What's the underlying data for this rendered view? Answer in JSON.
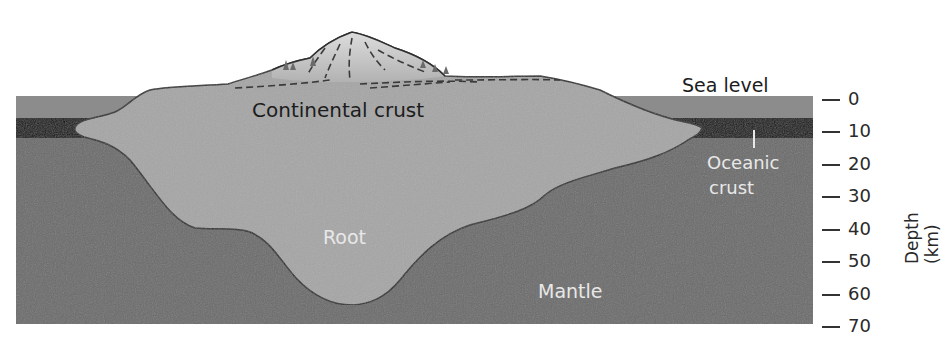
{
  "labels": {
    "sea_level": "Sea level",
    "continental_crust": "Continental crust",
    "oceanic_crust_line1": "Oceanic",
    "oceanic_crust_line2": "crust",
    "root": "Root",
    "mantle": "Mantle"
  },
  "axis": {
    "title": "Depth (km)",
    "ticks": [
      "0",
      "10",
      "20",
      "30",
      "40",
      "50",
      "60",
      "70"
    ]
  },
  "colors": {
    "ocean_water": "#8c8c8c",
    "oceanic_crust": "#141414",
    "continental_crust": "#a6a6a6",
    "mantle": "#6c6c6c",
    "mountain_snow": "#d8d8d8",
    "outline": "#2e2e2e"
  }
}
